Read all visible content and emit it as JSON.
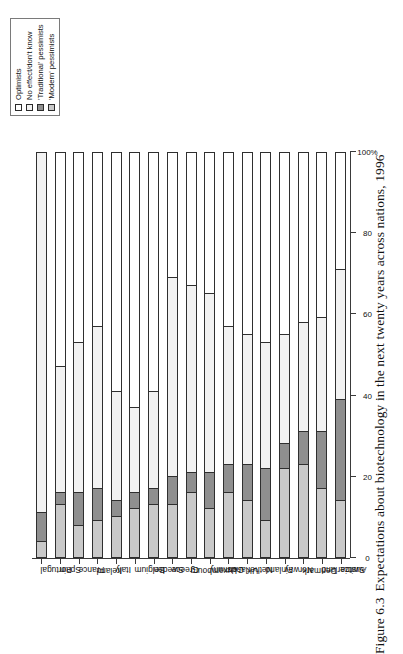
{
  "figure": {
    "caption_number": "Figure 6.3",
    "caption_text": "Expectations about biotechnology in the next twenty years across nations, 1996"
  },
  "legend": {
    "items": [
      {
        "label": "Optimists",
        "color": "#ffffff",
        "icon": "square-swatch-icon"
      },
      {
        "label": "No effect/don't know",
        "color": "#f2f2f2",
        "icon": "square-swatch-icon"
      },
      {
        "label": "'Traditional' pessimists",
        "color": "#8f8f8f",
        "icon": "square-swatch-icon"
      },
      {
        "label": "'Modern' pessimists",
        "color": "#c9c9c9",
        "icon": "square-swatch-icon"
      }
    ]
  },
  "axis": {
    "tick_labels": [
      "0",
      "20",
      "40",
      "60",
      "80",
      "100%"
    ],
    "tick_values": [
      0,
      20,
      40,
      60,
      80,
      100
    ]
  },
  "chart_data": {
    "type": "bar",
    "title": "Expectations about biotechnology in the next twenty years across nations, 1996",
    "orientation": "horizontal-rotated",
    "stacked": true,
    "stack_mode": "percent",
    "xlabel": "",
    "ylabel": "",
    "xlim": [
      0,
      100
    ],
    "grid": false,
    "legend_position": "top-right",
    "categories": [
      "Portugal",
      "Spain",
      "France",
      "Ireland",
      "Italy",
      "Belgium",
      "Sweden",
      "Greece",
      "Luxembourg",
      "Germany",
      "Netherlands",
      "UK",
      "Finland",
      "Norway",
      "Denmark",
      "Switzerland",
      "Austria"
    ],
    "series": [
      {
        "name": "'Modern' pessimists",
        "color": "#c9c9c9",
        "values": [
          4,
          13,
          8,
          9,
          10,
          12,
          13,
          13,
          16,
          12,
          16,
          14,
          9,
          22,
          23,
          17,
          14
        ]
      },
      {
        "name": "'Traditional' pessimists",
        "color": "#8f8f8f",
        "values": [
          7,
          3,
          8,
          8,
          4,
          4,
          4,
          7,
          5,
          9,
          7,
          9,
          13,
          6,
          8,
          14,
          25
        ]
      },
      {
        "name": "No effect/don't know",
        "color": "#f2f2f2",
        "values": [
          89,
          31,
          37,
          40,
          27,
          21,
          24,
          49,
          46,
          44,
          34,
          32,
          31,
          27,
          27,
          28,
          32
        ]
      },
      {
        "name": "Optimists",
        "color": "#ffffff",
        "values": [
          0,
          53,
          47,
          43,
          59,
          63,
          59,
          31,
          33,
          35,
          43,
          45,
          47,
          45,
          42,
          41,
          29
        ]
      }
    ]
  }
}
